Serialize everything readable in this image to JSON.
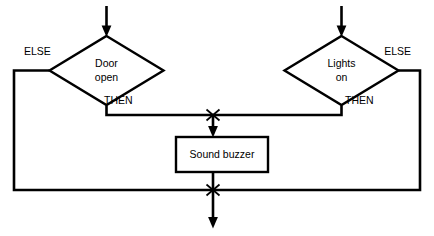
{
  "diagram": {
    "type": "flowchart",
    "background_color": "#ffffff",
    "line_color": "#000000",
    "nodes": [
      {
        "id": "door-open",
        "shape": "decision",
        "line1": "Door",
        "line2": "open",
        "cx": 106.5,
        "cy": 70.5,
        "rx": 57,
        "ry": 35
      },
      {
        "id": "lights-on",
        "shape": "decision",
        "line1": "Lights",
        "line2": "on",
        "cx": 341.5,
        "cy": 70.5,
        "rx": 57,
        "ry": 35
      },
      {
        "id": "sound-buzzer",
        "shape": "process",
        "label": "Sound buzzer",
        "x": 176,
        "y": 137,
        "width": 92,
        "height": 35
      }
    ],
    "edge_labels": [
      {
        "id": "else-left",
        "text": "ELSE",
        "x": 24,
        "y": 52,
        "anchor": "start"
      },
      {
        "id": "then-left",
        "text": "THEN",
        "x": 104,
        "y": 101,
        "anchor": "start"
      },
      {
        "id": "else-right",
        "text": "ELSE",
        "x": 411,
        "y": 52,
        "anchor": "end"
      },
      {
        "id": "then-right",
        "text": "THEN",
        "x": 345,
        "y": 101,
        "anchor": "start"
      }
    ],
    "connectors": [
      {
        "id": "input-left",
        "kind": "arrow",
        "from": "top",
        "to": "door-open"
      },
      {
        "id": "input-right",
        "kind": "arrow",
        "from": "top",
        "to": "lights-on"
      },
      {
        "id": "then-left-path",
        "kind": "line",
        "from": "door-open",
        "to": "merge-upper"
      },
      {
        "id": "then-right-path",
        "kind": "line",
        "from": "lights-on",
        "to": "merge-upper"
      },
      {
        "id": "else-left-path",
        "kind": "line",
        "from": "door-open",
        "to": "merge-lower"
      },
      {
        "id": "else-right-path",
        "kind": "line",
        "from": "lights-on",
        "to": "merge-lower"
      },
      {
        "id": "buzzer-in",
        "kind": "arrow",
        "from": "merge-upper",
        "to": "sound-buzzer"
      },
      {
        "id": "buzzer-out",
        "kind": "line",
        "from": "sound-buzzer",
        "to": "merge-lower"
      },
      {
        "id": "output-bottom",
        "kind": "arrow",
        "from": "merge-lower",
        "to": "exit"
      }
    ],
    "junctions": [
      {
        "id": "merge-upper",
        "x": 213,
        "y": 115,
        "marker": "asterisk"
      },
      {
        "id": "merge-lower",
        "x": 213,
        "y": 190,
        "marker": "asterisk"
      }
    ]
  }
}
